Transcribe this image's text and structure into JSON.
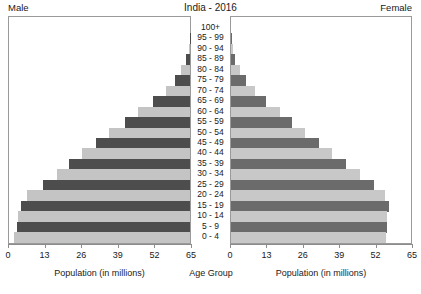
{
  "header": {
    "left_label": "Male",
    "title": "India - 2016",
    "right_label": "Female"
  },
  "axis": {
    "left_title": "Population (in millions)",
    "center_title": "Age Group",
    "right_title": "Population (in millions)",
    "left_ticks": [
      "65",
      "52",
      "39",
      "26",
      "13",
      "0"
    ],
    "right_ticks": [
      "0",
      "13",
      "26",
      "39",
      "52",
      "65"
    ]
  },
  "colors": {
    "bar_dark_male": "#4d4d4d",
    "bar_light_male": "#c4c4c4",
    "bar_dark_female": "#6b6b6b",
    "bar_light_female": "#c8c8c8",
    "frame": "#9a9a9a",
    "background": "#ffffff",
    "text": "#1a1a1a"
  },
  "chart_data": {
    "type": "bar",
    "subtype": "population-pyramid",
    "title": "India - 2016",
    "xlabel": "Population (in millions)",
    "ylabel": "Age Group",
    "xlim": [
      0,
      65
    ],
    "xticks": [
      0,
      13,
      26,
      39,
      52,
      65
    ],
    "grid": false,
    "legend": "none",
    "orientation": "horizontal",
    "categories": [
      "100+",
      "95 - 99",
      "90 - 94",
      "85 - 89",
      "80 - 84",
      "75 - 79",
      "70 - 74",
      "65 - 69",
      "60 - 64",
      "55 - 59",
      "50 - 54",
      "45 - 49",
      "40 - 44",
      "35 - 39",
      "30 - 34",
      "25 - 29",
      "20 - 24",
      "15 - 19",
      "10 - 14",
      "5 - 9",
      "0 - 4"
    ],
    "series": [
      {
        "name": "Male",
        "side": "left",
        "values": [
          0.0,
          0.1,
          0.4,
          1.3,
          3.1,
          5.2,
          8.6,
          13.2,
          18.6,
          23.2,
          28.6,
          33.3,
          38.2,
          43.1,
          47.3,
          52.1,
          57.9,
          60.2,
          61.2,
          61.6,
          62.6
        ]
      },
      {
        "name": "Female",
        "side": "right",
        "values": [
          0.0,
          0.2,
          0.6,
          1.6,
          3.3,
          5.3,
          8.4,
          12.6,
          17.5,
          21.8,
          26.5,
          31.3,
          36.0,
          41.2,
          46.1,
          50.9,
          55.0,
          56.3,
          55.8,
          55.6,
          55.4
        ]
      }
    ]
  }
}
